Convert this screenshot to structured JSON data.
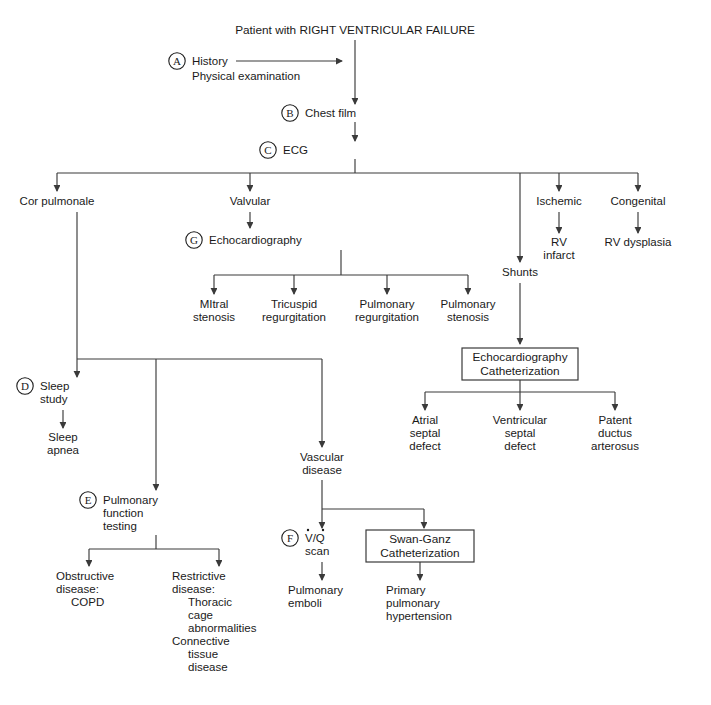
{
  "diagram": {
    "title": "Patient with RIGHT VENTRICULAR FAILURE",
    "type": "clinical-algorithm-flowchart",
    "nodes": {
      "root": "Patient with RIGHT VENTRICULAR FAILURE",
      "history": "History",
      "physical_examination": "Physical examination",
      "chest_film": "Chest film",
      "ecg": "ECG",
      "cor_pulmonale": "Cor pulmonale",
      "valvular": "Valvular",
      "ischemic": "Ischemic",
      "congenital": "Congenital",
      "rv_infarct_1": "RV",
      "rv_infarct_2": "infarct",
      "rv_dysplasia": "RV dysplasia",
      "echocardiography": "Echocardiography",
      "shunts": "Shunts",
      "mitral_1": "MItral",
      "mitral_2": "stenosis",
      "tricuspid_1": "Tricuspid",
      "tricuspid_2": "regurgitation",
      "pulm_regurg_1": "Pulmonary",
      "pulm_regurg_2": "regurgitation",
      "pulm_sten_1": "Pulmonary",
      "pulm_sten_2": "stenosis",
      "echo_cath_line1": "Echocardiography",
      "echo_cath_line2": "Catheterization",
      "atrial_1": "Atrial",
      "atrial_2": "septal",
      "atrial_3": "defect",
      "ventricular_1": "Ventricular",
      "ventricular_2": "septal",
      "ventricular_3": "defect",
      "patent_1": "Patent",
      "patent_2": "ductus",
      "patent_3": "arterosus",
      "sleep_study_1": "Sleep",
      "sleep_study_2": "study",
      "sleep_apnea_1": "Sleep",
      "sleep_apnea_2": "apnea",
      "pft_1": "Pulmonary",
      "pft_2": "function",
      "pft_3": "testing",
      "vascular_1": "Vascular",
      "vascular_2": "disease",
      "obstructive_1": "Obstructive",
      "obstructive_2": "disease:",
      "obstructive_3": "COPD",
      "restrictive_1": "Restrictive",
      "restrictive_2": "disease:",
      "restrictive_3": "Thoracic",
      "restrictive_4": "cage",
      "restrictive_5": "abnormalities",
      "restrictive_6": "Connective",
      "restrictive_7": "tissue",
      "restrictive_8": "disease",
      "vq_scan_1": "V/Q",
      "vq_scan_2": "scan",
      "swan_ganz_line1": "Swan-Ganz",
      "swan_ganz_line2": "Catheterization",
      "pulmonary_emboli_1": "Pulmonary",
      "pulmonary_emboli_2": "emboli",
      "primary_ph_1": "Primary",
      "primary_ph_2": "pulmonary",
      "primary_ph_3": "hypertension"
    },
    "markers": {
      "a": "A",
      "b": "B",
      "c": "C",
      "d": "D",
      "e": "E",
      "f": "F",
      "g": "G"
    },
    "colors": {
      "background": "#ffffff",
      "text": "#1a1a1a",
      "edge": "#3a3a3a",
      "box_border": "#3a3a3a"
    }
  }
}
